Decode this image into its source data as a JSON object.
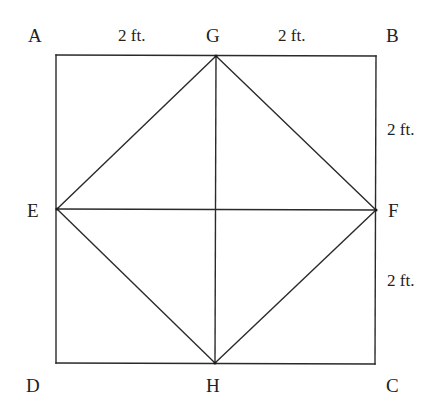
{
  "diagram": {
    "points": {
      "A": {
        "label": "A",
        "x": 56,
        "y": 55
      },
      "B": {
        "label": "B",
        "x": 376,
        "y": 56
      },
      "C": {
        "label": "C",
        "x": 375,
        "y": 364
      },
      "D": {
        "label": "D",
        "x": 56,
        "y": 363
      },
      "G": {
        "label": "G",
        "x": 216,
        "y": 56
      },
      "H": {
        "label": "H",
        "x": 215,
        "y": 363
      },
      "E": {
        "label": "E",
        "x": 57,
        "y": 209
      },
      "F": {
        "label": "F",
        "x": 376,
        "y": 210
      }
    },
    "segments": [
      {
        "from": "A",
        "to": "B"
      },
      {
        "from": "B",
        "to": "C"
      },
      {
        "from": "C",
        "to": "D"
      },
      {
        "from": "D",
        "to": "A"
      },
      {
        "from": "E",
        "to": "G"
      },
      {
        "from": "G",
        "to": "F"
      },
      {
        "from": "F",
        "to": "H"
      },
      {
        "from": "H",
        "to": "E"
      },
      {
        "from": "E",
        "to": "F"
      },
      {
        "from": "G",
        "to": "H"
      }
    ],
    "labels": {
      "A": "A",
      "B": "B",
      "C": "C",
      "D": "D",
      "E": "E",
      "F": "F",
      "G": "G",
      "H": "H"
    },
    "dimensions": {
      "AG": "2 ft.",
      "GB": "2 ft.",
      "BF": "2 ft.",
      "FC": "2 ft."
    },
    "line_color": "#2a2a2a",
    "text_color": "#222222"
  }
}
